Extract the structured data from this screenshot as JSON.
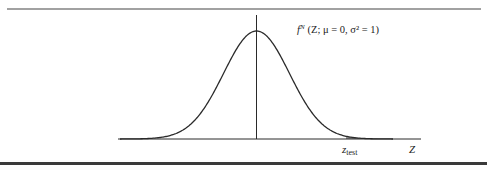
{
  "figure": {
    "curve_label": "f",
    "curve_label_sup": "N",
    "curve_label_args": "(Z; μ = 0, σ² = 1)",
    "test_stat_label": "z",
    "test_stat_sub": "test",
    "axis_label": "Z",
    "colors": {
      "line": "#2a2a2a",
      "shade": "#8f8f8f",
      "rule_bottom": "#3a3a3a"
    }
  },
  "chart_data": {
    "type": "area",
    "curve": "f^N (Z; μ = 0, σ² = 1)",
    "distribution": {
      "mean": 0,
      "variance": 1
    },
    "xlabel": "Z",
    "ylabel": "",
    "annotations": [
      "z_test"
    ],
    "shaded_region": "right tail beyond z_test",
    "x_range": [
      -3.6,
      3.6
    ],
    "grid": false
  }
}
